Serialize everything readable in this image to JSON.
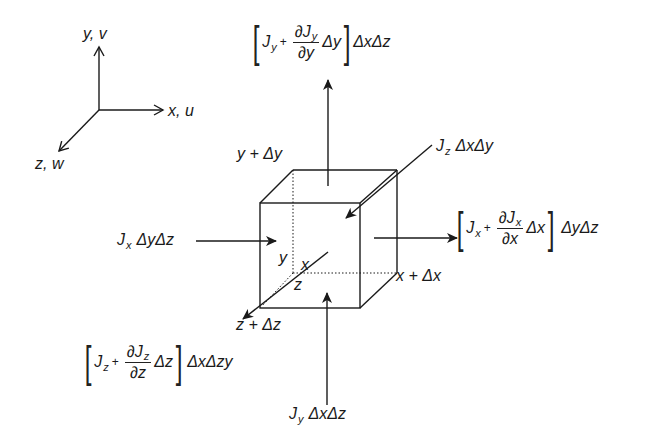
{
  "diagram": {
    "type": "control-volume-flux-diagram",
    "axes": {
      "y_label": "y, v",
      "x_label": "x, u",
      "z_label": "z, w"
    },
    "cube_labels": {
      "top_face": "y + Δy",
      "right_face": "x + Δx",
      "front_face": "z + Δz",
      "origin_y": "y",
      "origin_x": "x",
      "origin_z": "z"
    },
    "fluxes": {
      "top_out": {
        "J": "J",
        "J_sub": "y",
        "plus": "+",
        "d_num": "∂J",
        "d_num_sub": "y",
        "d_den": "∂y",
        "delta": "Δy",
        "area": "ΔxΔz"
      },
      "right_out": {
        "J": "J",
        "J_sub": "x",
        "plus": "+",
        "d_num": "∂J",
        "d_num_sub": "x",
        "d_den": "∂x",
        "delta": "Δx",
        "area": "ΔyΔz"
      },
      "front_out": {
        "J": "J",
        "J_sub": "z",
        "plus": "+",
        "d_num": "∂J",
        "d_num_sub": "z",
        "d_den": "∂z",
        "delta": "Δz",
        "area": "ΔxΔzy"
      },
      "left_in": {
        "J": "J",
        "J_sub": "x",
        "area": "ΔyΔz"
      },
      "bottom_in": {
        "J": "J",
        "J_sub": "y",
        "area": "ΔxΔz"
      },
      "back_in": {
        "J": "J",
        "J_sub": "z",
        "area": "ΔxΔy"
      }
    },
    "colors": {
      "stroke": "#1a1a1a",
      "background": "#ffffff"
    }
  }
}
